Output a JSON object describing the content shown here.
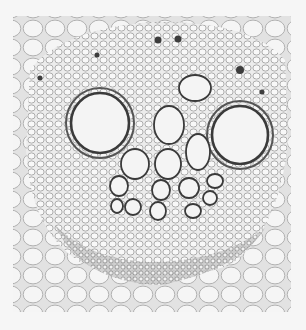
{
  "image": {
    "subject": "micrograph cross-section of plant vascular bundle",
    "background_color": "#f6f6f6",
    "tissue_color": "#e9e9e9",
    "cell_wall_color": "#3a3a3a",
    "vessels": [
      {
        "cx": 100,
        "cy": 123,
        "rx": 29,
        "ry": 30
      },
      {
        "cx": 240,
        "cy": 135,
        "rx": 28,
        "ry": 29
      },
      {
        "cx": 195,
        "cy": 88,
        "rx": 16,
        "ry": 13
      },
      {
        "cx": 169,
        "cy": 125,
        "rx": 15,
        "ry": 19
      },
      {
        "cx": 198,
        "cy": 152,
        "rx": 12,
        "ry": 18
      },
      {
        "cx": 135,
        "cy": 164,
        "rx": 14,
        "ry": 15
      },
      {
        "cx": 168,
        "cy": 164,
        "rx": 13,
        "ry": 15
      },
      {
        "cx": 119,
        "cy": 186,
        "rx": 9,
        "ry": 10
      },
      {
        "cx": 161,
        "cy": 190,
        "rx": 9,
        "ry": 10
      },
      {
        "cx": 189,
        "cy": 188,
        "rx": 10,
        "ry": 10
      },
      {
        "cx": 215,
        "cy": 181,
        "rx": 8,
        "ry": 7
      },
      {
        "cx": 210,
        "cy": 198,
        "rx": 7,
        "ry": 7
      },
      {
        "cx": 133,
        "cy": 207,
        "rx": 8,
        "ry": 8
      },
      {
        "cx": 158,
        "cy": 211,
        "rx": 8,
        "ry": 9
      },
      {
        "cx": 193,
        "cy": 211,
        "rx": 8,
        "ry": 7
      },
      {
        "cx": 117,
        "cy": 206,
        "rx": 6,
        "ry": 7
      }
    ]
  }
}
